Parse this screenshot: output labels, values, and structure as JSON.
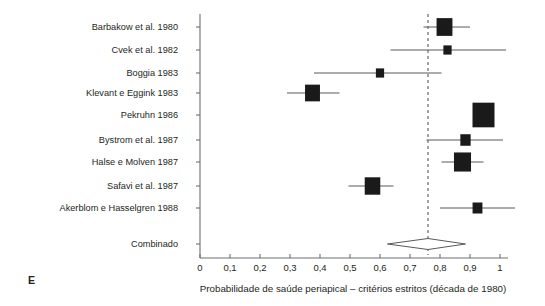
{
  "panel": {
    "letter": "E"
  },
  "axis": {
    "x_title": "Probabilidade de saúde periapical – critérios estritos (década de 1980)",
    "tick_labels": [
      "0",
      "0,1",
      "0,2",
      "0,3",
      "0,4",
      "0,5",
      "0,6",
      "0,7",
      "0,8",
      "0,9",
      "1"
    ],
    "tick_values": [
      0,
      0.1,
      0.2,
      0.3,
      0.4,
      0.5,
      0.6,
      0.7,
      0.8,
      0.9,
      1.0
    ],
    "xmin": 0,
    "xmax": 1
  },
  "chart_data": {
    "type": "forest",
    "title": "",
    "xlabel": "Probabilidade de saúde periapical – critérios estritos (década de 1980)",
    "ylabel": "",
    "xlim": [
      0,
      1
    ],
    "grid": false,
    "legend": null,
    "reference_line": 0.76,
    "categories": [
      "Barbakow et al. 1980",
      "Cvek et al. 1982",
      "Boggia 1983",
      "Klevant e Eggink 1983",
      "Pekruhn 1986",
      "Bystrom et al. 1987",
      "Halse e Molven 1987",
      "Safavi et al. 1987",
      "Akerblom e Hasselgren 1988"
    ],
    "studies": [
      {
        "label": "Barbakow et al. 1980",
        "estimate": 0.815,
        "ci_low": 0.745,
        "ci_high": 0.9,
        "weight": 0.52
      },
      {
        "label": "Cvek et al. 1982",
        "estimate": 0.825,
        "ci_low": 0.635,
        "ci_high": 1.02,
        "weight": 0.14
      },
      {
        "label": "Boggia 1983",
        "estimate": 0.6,
        "ci_low": 0.38,
        "ci_high": 0.805,
        "weight": 0.14
      },
      {
        "label": "Klevant e Eggink 1983",
        "estimate": 0.375,
        "ci_low": 0.29,
        "ci_high": 0.465,
        "weight": 0.46
      },
      {
        "label": "Pekruhn 1986",
        "estimate": 0.945,
        "ci_low": 0.915,
        "ci_high": 0.98,
        "weight": 1.0
      },
      {
        "label": "Bystrom et al. 1987",
        "estimate": 0.885,
        "ci_low": 0.755,
        "ci_high": 1.01,
        "weight": 0.22
      },
      {
        "label": "Halse e Molven 1987",
        "estimate": 0.875,
        "ci_low": 0.805,
        "ci_high": 0.945,
        "weight": 0.6
      },
      {
        "label": "Safavi et al. 1987",
        "estimate": 0.575,
        "ci_low": 0.495,
        "ci_high": 0.645,
        "weight": 0.5
      },
      {
        "label": "Akerblom e Hasselgren 1988",
        "estimate": 0.925,
        "ci_low": 0.8,
        "ci_high": 1.05,
        "weight": 0.2
      }
    ],
    "summary": {
      "label": "Combinado",
      "estimate": 0.76,
      "ci_low": 0.625,
      "ci_high": 0.885
    }
  }
}
